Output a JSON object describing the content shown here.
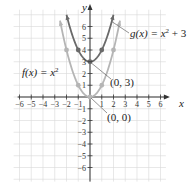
{
  "chart_data": {
    "type": "line",
    "title": "",
    "xlabel": "x",
    "ylabel": "y",
    "xlim": [
      -6.5,
      6.8
    ],
    "ylim": [
      -7.2,
      7.6
    ],
    "grid": true,
    "x_ticks": [
      -6,
      -5,
      -4,
      -3,
      -2,
      -1,
      1,
      2,
      3,
      4,
      5,
      6
    ],
    "x_tick_labels": [
      "−6",
      "−5",
      "−4",
      "−3",
      "−2",
      "−1",
      "1",
      "2",
      "3",
      "4",
      "5",
      "6"
    ],
    "y_ticks": [
      -6,
      -5,
      -4,
      -3,
      -2,
      -1,
      1,
      2,
      3,
      4,
      5,
      6
    ],
    "y_tick_labels": [
      "−6",
      "−5",
      "−4",
      "−3",
      "−2",
      "−1",
      "1",
      "2",
      "3",
      "4",
      "5",
      "6"
    ],
    "series": [
      {
        "name": "f(x) = x²",
        "expression": "x^2",
        "color": "#b5b5b5",
        "domain": [
          -2.55,
          2.55
        ],
        "marked_points": [
          [
            -2,
            4
          ],
          [
            -1,
            1
          ],
          [
            0,
            0
          ],
          [
            1,
            1
          ],
          [
            2,
            4
          ]
        ]
      },
      {
        "name": "g(x) = x² + 3",
        "expression": "x^2 + 3",
        "color": "#6a6a6a",
        "domain": [
          -2.0,
          2.0
        ],
        "marked_points": [
          [
            -1,
            4
          ],
          [
            0,
            3
          ],
          [
            1,
            4
          ]
        ]
      }
    ],
    "annotations": [
      {
        "label": "f(x) = x",
        "sup": "2",
        "suffix": "",
        "target": "f"
      },
      {
        "label": "g(x) = x",
        "sup": "2",
        "suffix": " + 3",
        "target": "g"
      },
      {
        "label": "(0, 3)",
        "point": [
          0,
          3
        ]
      },
      {
        "label": "(0, 0)",
        "point": [
          0,
          0
        ]
      }
    ]
  }
}
